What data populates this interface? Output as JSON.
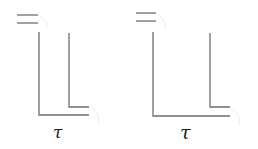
{
  "diagram": {
    "figures": [
      {
        "name": "left",
        "label": "τ",
        "label_pos": [
          57,
          138
        ],
        "label_size": 16,
        "double_bar": {
          "x1": 17,
          "x2": 38,
          "y": [
            15,
            23
          ]
        },
        "outer": {
          "x": 39,
          "y_top": 32,
          "y_bottom": 115,
          "x_end": 89
        },
        "inner": {
          "x": 69,
          "y_top": 33,
          "y_bottom": 107,
          "x_end": 89
        }
      },
      {
        "name": "right",
        "label": "τ",
        "label_pos": [
          185,
          139
        ],
        "label_size": 19,
        "double_bar": {
          "x1": 136,
          "x2": 156,
          "y": [
            13,
            21
          ]
        },
        "outer": {
          "x": 153,
          "y_top": 32,
          "y_bottom": 116,
          "x_end": 230
        },
        "inner": {
          "x": 210,
          "y_top": 33,
          "y_bottom": 107,
          "x_end": 230
        }
      }
    ],
    "colors": {
      "line": "#6e6e6e",
      "text": "#222222",
      "ghost": "#ececec"
    }
  }
}
